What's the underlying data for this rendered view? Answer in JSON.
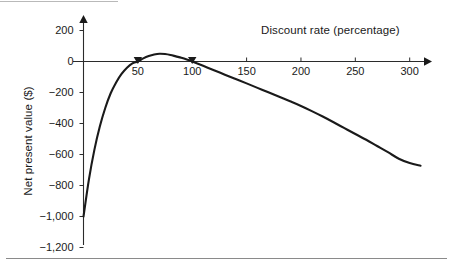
{
  "figure": {
    "background_color": "#ffffff",
    "curve_color": "#1a1a1a",
    "axis_color": "#2b2b2b",
    "rule_color": "#8a8a8a"
  },
  "chart_data": {
    "type": "line",
    "title": "",
    "xlabel": "Discount rate (percentage)",
    "ylabel": "Net present value ($)",
    "xlim": [
      0,
      315
    ],
    "ylim": [
      -1200,
      260
    ],
    "grid": false,
    "legend": null,
    "xticks": [
      50,
      100,
      150,
      200,
      250,
      300
    ],
    "xtick_labels": [
      "50",
      "100",
      "150",
      "200",
      "250",
      "300"
    ],
    "yticks": [
      200,
      0,
      -200,
      -400,
      -600,
      -800,
      -1000,
      -1200
    ],
    "ytick_labels": [
      "200",
      "0",
      "−200",
      "−400",
      "−600",
      "−800",
      "−1,000",
      "−1,200"
    ],
    "series": [
      {
        "name": "Net present value",
        "x": [
          0,
          5,
          10,
          15,
          20,
          25,
          30,
          35,
          40,
          45,
          50,
          55,
          60,
          65,
          70,
          75,
          80,
          85,
          90,
          95,
          100,
          110,
          120,
          130,
          140,
          150,
          160,
          170,
          180,
          190,
          200,
          210,
          220,
          230,
          240,
          250,
          260,
          270,
          280,
          290,
          300,
          310
        ],
        "y": [
          -1000,
          -760,
          -570,
          -420,
          -300,
          -205,
          -135,
          -80,
          -40,
          -12,
          0,
          20,
          35,
          45,
          50,
          48,
          42,
          33,
          24,
          13,
          0,
          -28,
          -56,
          -85,
          -113,
          -141,
          -170,
          -199,
          -228,
          -257,
          -287,
          -320,
          -355,
          -392,
          -430,
          -468,
          -505,
          -545,
          -585,
          -627,
          -655,
          -672
        ]
      }
    ],
    "annotations": [
      {
        "name": "zero-crossing-lower",
        "x": 50,
        "y": 0,
        "marker": "arrow"
      },
      {
        "name": "zero-crossing-upper",
        "x": 100,
        "y": 0,
        "marker": "arrow"
      }
    ]
  },
  "axis_titles": {
    "x": "Discount rate (percentage)",
    "y": "Net present value ($)"
  }
}
